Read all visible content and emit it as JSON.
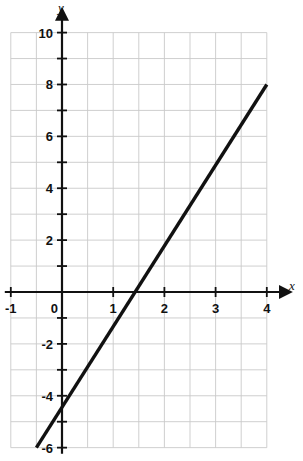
{
  "chart_data": {
    "type": "line",
    "title": "",
    "xlabel": "x",
    "ylabel": "y",
    "equation": "y = 3x - 4",
    "slope": 3,
    "y_intercept": -4,
    "x_intercept": 1.3333,
    "xlim": [
      -1,
      4
    ],
    "ylim": [
      -6,
      10
    ],
    "grid": true,
    "grid_step_x": 0.5,
    "grid_step_y": 1,
    "tick_step_x": 1,
    "tick_step_y": 1,
    "x_tick_labels": [
      "-1",
      "0",
      "1",
      "2",
      "3",
      "4"
    ],
    "x_tick_values": [
      -1,
      0,
      1,
      2,
      3,
      4
    ],
    "y_tick_labels": [
      "10",
      "8",
      "6",
      "4",
      "2",
      "0",
      "-2",
      "-4",
      "-6"
    ],
    "y_tick_values": [
      10,
      8,
      6,
      4,
      2,
      0,
      -2,
      -4,
      -6
    ],
    "legend": "none",
    "series": [
      {
        "name": "line",
        "color": "#111111",
        "x": [
          -0.5,
          4
        ],
        "y": [
          -6,
          8
        ],
        "points": [
          [
            -0.5,
            -6
          ],
          [
            0,
            -4
          ],
          [
            1.3333,
            0
          ],
          [
            2,
            2
          ],
          [
            4,
            8
          ]
        ]
      }
    ],
    "annotations": []
  },
  "axes": {
    "x_axis_label": "x",
    "y_axis_label": "y",
    "origin_label": "0"
  },
  "colors": {
    "grid": "#c9c9c9",
    "axis": "#111111",
    "line": "#111111",
    "background": "#ffffff"
  }
}
